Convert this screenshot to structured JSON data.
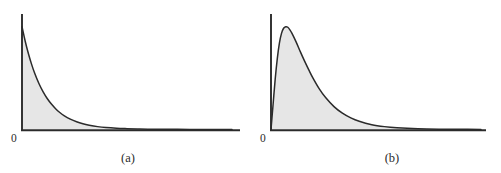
{
  "figure": {
    "background_color": "#ffffff",
    "width": 501,
    "height": 173
  },
  "style": {
    "axis_color": "#2b2b2b",
    "curve_color": "#2b2b2b",
    "fill_color": "#e6e6e6",
    "text_color": "#2b2b2b"
  },
  "panels": [
    {
      "id": "a",
      "caption": "(a)",
      "origin_label": "0",
      "shape": "exponential-decay"
    },
    {
      "id": "b",
      "caption": "(b)",
      "origin_label": "0",
      "shape": "right-skewed-unimodal"
    }
  ],
  "chart_data": [
    {
      "type": "area",
      "title": "",
      "subtitle": "",
      "xlabel": "",
      "ylabel": "",
      "legend": [],
      "grid": false,
      "axes": {
        "x_ticks": [
          "0"
        ],
        "y_ticks": [],
        "x_axis_visible": true,
        "y_axis_visible": true,
        "xlim": [
          0,
          10
        ],
        "ylim": [
          0,
          1.08
        ]
      },
      "annotations": [
        "(a)"
      ],
      "description": "Exponential probability density, maximum at x = 0, monotone decreasing toward the horizontal axis.",
      "x": [
        0.0,
        0.15,
        0.3,
        0.45,
        0.6,
        0.8,
        1.0,
        1.2,
        1.4,
        1.6,
        1.8,
        2.0,
        2.3,
        2.6,
        2.9,
        3.2,
        3.6,
        4.0,
        4.5,
        5.0,
        5.5,
        6.0,
        7.0,
        8.0,
        9.0,
        10.0
      ],
      "y": [
        1.0,
        0.861,
        0.741,
        0.638,
        0.549,
        0.449,
        0.368,
        0.301,
        0.247,
        0.202,
        0.165,
        0.135,
        0.1,
        0.074,
        0.055,
        0.041,
        0.027,
        0.018,
        0.011,
        0.007,
        0.004,
        0.002,
        0.001,
        0.0,
        0.0,
        0.0
      ],
      "fill_under": true
    },
    {
      "type": "area",
      "title": "",
      "subtitle": "",
      "xlabel": "",
      "ylabel": "",
      "legend": [],
      "grid": false,
      "axes": {
        "x_ticks": [
          "0"
        ],
        "y_ticks": [],
        "x_axis_visible": true,
        "y_axis_visible": true,
        "xlim": [
          0,
          10
        ],
        "ylim": [
          0,
          1.08
        ]
      },
      "annotations": [
        "(b)"
      ],
      "description": "Right-skewed unimodal density, zero at x = 0, rises steeply to a peak near x = 0.8, then decays with a long right tail.",
      "x": [
        0.0,
        0.1,
        0.2,
        0.3,
        0.4,
        0.5,
        0.6,
        0.7,
        0.8,
        0.9,
        1.0,
        1.2,
        1.4,
        1.6,
        1.8,
        2.0,
        2.3,
        2.6,
        3.0,
        3.4,
        3.8,
        4.2,
        4.8,
        5.4,
        6.0,
        7.0,
        8.0,
        9.0,
        10.0
      ],
      "y": [
        0.0,
        0.245,
        0.49,
        0.69,
        0.84,
        0.935,
        0.985,
        1.0,
        0.995,
        0.97,
        0.935,
        0.85,
        0.755,
        0.665,
        0.58,
        0.5,
        0.395,
        0.31,
        0.222,
        0.158,
        0.112,
        0.079,
        0.046,
        0.027,
        0.016,
        0.006,
        0.002,
        0.001,
        0.0
      ],
      "fill_under": true
    }
  ]
}
